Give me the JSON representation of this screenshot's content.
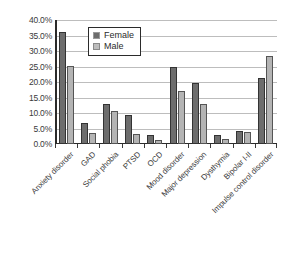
{
  "chart_data": {
    "type": "bar",
    "title": "",
    "subtitle": "",
    "xlabel": "",
    "ylabel": "",
    "ylim": [
      0,
      40
    ],
    "ytick_labels": [
      "40.0%",
      "35.0%",
      "30.0%",
      "25.0%",
      "20.0%",
      "15.0%",
      "10.0%",
      "5.0%",
      "0.0%"
    ],
    "ytick_values": [
      40,
      35,
      30,
      25,
      20,
      15,
      10,
      5,
      0
    ],
    "grid": true,
    "legend_position": "upper-center",
    "categories": [
      "Anxiety disorder",
      "GAD",
      "Social phobia",
      "PTSD",
      "OCD",
      "Mood disorder",
      "Major depression",
      "Dysthymia",
      "Bipolar I-II",
      "Impulse control disorder"
    ],
    "series": [
      {
        "name": "Female",
        "color": "#6d6d6d",
        "values": [
          36.0,
          6.8,
          12.8,
          9.5,
          2.8,
          24.8,
          19.8,
          2.9,
          4.1,
          21.2
        ]
      },
      {
        "name": "Male",
        "color": "#b4b4b4",
        "values": [
          25.2,
          3.7,
          10.8,
          3.3,
          1.3,
          17.1,
          12.9,
          1.5,
          4.0,
          28.4
        ]
      }
    ]
  },
  "legend": {
    "items": [
      {
        "label": "Female",
        "swatch": "female-swatch-icon"
      },
      {
        "label": "Male",
        "swatch": "male-swatch-icon"
      }
    ]
  }
}
